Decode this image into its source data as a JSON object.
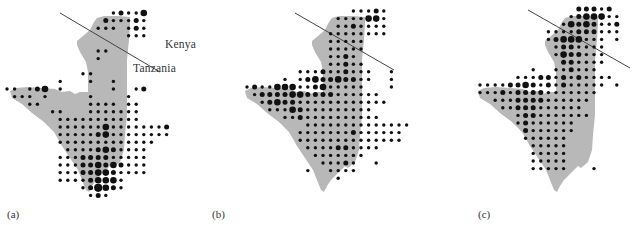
{
  "figure": {
    "colors": {
      "land": "#b8b8b8",
      "dot": "#111111",
      "border_line": "#444444",
      "background": "#ffffff"
    },
    "grid": {
      "step": 7.6
    },
    "dot_radius": {
      "1": 1.7,
      "2": 2.5,
      "3": 3.3,
      "4": 4.1
    },
    "country_labels": [
      {
        "text": "Kenya",
        "x": 165,
        "y": 49
      },
      {
        "text": "Tanzania",
        "x": 133,
        "y": 73
      }
    ],
    "panels": [
      {
        "label": "(a)",
        "label_x": 7,
        "offset_x": 0,
        "x0": 7,
        "y0": 13,
        "line": [
          60,
          13,
          160,
          72
        ],
        "rows": [
          "..............12113...",
          ".............211121...",
          "............111.121...",
          "................111...",
          "......................",
          "............11........",
          "............1.........",
          "......................",
          "..........11..........",
          ".......1...1..1.......",
          "11.123.1......1..12...",
          ".111.1.....1....1.....",
          "...11......1111.11....",
          "......11...1111111....",
          ".......11111111111....",
          ".......111111311111112",
          ".......111112311111111",
          ".......1111111111111..",
          "........11112321111...",
          ".......111222211111...",
          ".......111223232111...",
          ".......111223321111...",
          ".......111123331......",
          "..........124321......",
          "...........121........"
        ]
      },
      {
        "label": "(b)",
        "label_x": 212,
        "offset_x": 235,
        "x0": 247,
        "y0": 11,
        "line": [
          295,
          13,
          394,
          70
        ],
        "rows": [
          "..............11121...",
          "............1111331...",
          "............1121111...",
          "...........11111111...",
          "...........11111......",
          "...........11111......",
          "...........1121.......",
          "...........11211......",
          ".......1112112111..1..",
          ".....1.1232232211..1..",
          "1211333112311111...1..",
          ".12222332222111111....",
          "..12322111111111111...",
          "...11132111111111.....",
          ".....1121111111111....",
          "........11111111111111",
          ".......11111112111111.",
          ".......11111111111111.",
          "........1111221111....",
          ".........1111111......",
          "..........11121..1....",
          "........1..1111.......",
          "............1........."
        ]
      },
      {
        "label": "(c)",
        "label_x": 478,
        "offset_x": 468,
        "x0": 480,
        "y0": 9,
        "line": [
          528,
          10,
          630,
          68
        ],
        "rows": [
          ".............22212....",
          "............1233311...",
          "...........13232112...",
          ".........1111222111...",
          ".........12333111.1...",
          "..........1221111.....",
          "..........1322111.....",
          "...........221111.....",
          ".......1..112111......",
          ".....1112212121111....",
          "11112232121211111.1...",
          "1112122221111111......",
          "..1112222111111.......",
          "...11222111111........",
          ".....1221111111.......",
          ".....12111111.........",
          "......2111111.........",
          "......111111..........",
          ".......11111..........",
          ".......11111..........",
          ".......11111..........",
          ".......11111...1......"
        ]
      }
    ]
  }
}
